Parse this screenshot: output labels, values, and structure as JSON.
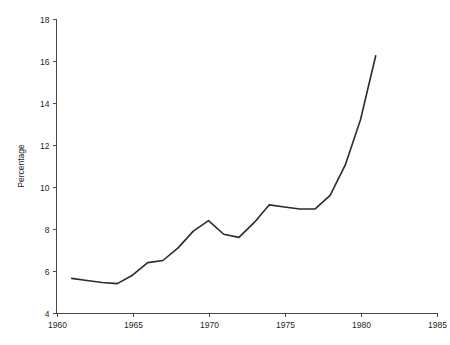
{
  "chart_data": {
    "type": "line",
    "title": "",
    "xlabel": "",
    "ylabel": "Percentage",
    "xlim": [
      1960,
      1985
    ],
    "ylim": [
      4,
      18
    ],
    "xticks": [
      1960,
      1965,
      1970,
      1975,
      1980,
      1985
    ],
    "yticks": [
      4,
      6,
      8,
      10,
      12,
      14,
      16,
      18
    ],
    "grid": false,
    "legend": false,
    "legend_position": "none",
    "x": [
      1961,
      1962,
      1963,
      1964,
      1965,
      1966,
      1967,
      1968,
      1969,
      1970,
      1971,
      1972,
      1973,
      1974,
      1975,
      1976,
      1977,
      1978,
      1979,
      1980,
      1981
    ],
    "values": [
      5.65,
      5.55,
      5.45,
      5.4,
      5.8,
      6.4,
      6.5,
      7.1,
      7.9,
      8.4,
      7.75,
      7.6,
      8.3,
      9.15,
      9.05,
      8.95,
      8.95,
      9.6,
      11.05,
      13.2,
      16.25
    ],
    "series": [
      {
        "name": "Percentage",
        "color": "#2b2b2b",
        "values": [
          5.65,
          5.55,
          5.45,
          5.4,
          5.8,
          6.4,
          6.5,
          7.1,
          7.9,
          8.4,
          7.75,
          7.6,
          8.3,
          9.15,
          9.05,
          8.95,
          8.95,
          9.6,
          11.05,
          13.2,
          16.25
        ]
      }
    ]
  },
  "axes": {
    "y_title": "Percentage",
    "y_tick_labels": [
      "18",
      "16",
      "14",
      "12",
      "10",
      "8",
      "6",
      "4"
    ],
    "x_tick_labels": [
      "1960",
      "1965",
      "1970",
      "1975",
      "1980",
      "1985"
    ]
  },
  "colors": {
    "line": "#2b2b2b",
    "axis": "#4a4a4a",
    "text": "#262626",
    "background": "#ffffff"
  }
}
